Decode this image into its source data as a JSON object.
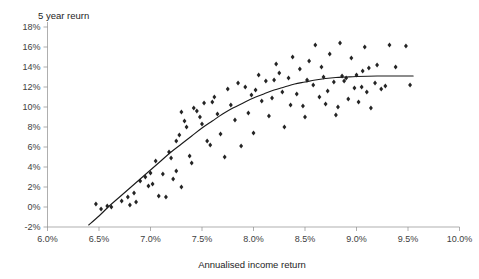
{
  "chart_data": {
    "type": "scatter",
    "title": "",
    "ylabel": "5 year reurn",
    "xlabel": "Annualised income return",
    "xlim": [
      6.0,
      10.0
    ],
    "ylim": [
      -2,
      18
    ],
    "grid": false,
    "legend": "none",
    "x_ticks": [
      "6.0%",
      "6.5%",
      "7.0%",
      "7.5%",
      "8.0%",
      "8.5%",
      "9.0%",
      "9.5%",
      "10.0%"
    ],
    "x_tick_values": [
      6.0,
      6.5,
      7.0,
      7.5,
      8.0,
      8.5,
      9.0,
      9.5,
      10.0
    ],
    "y_ticks": [
      "18%",
      "16%",
      "14%",
      "12%",
      "10%",
      "8%",
      "6%",
      "4%",
      "2%",
      "0%",
      "-2%"
    ],
    "y_tick_values": [
      18,
      16,
      14,
      12,
      10,
      8,
      6,
      4,
      2,
      0,
      -2
    ],
    "marker": "diamond",
    "marker_color": "#242424",
    "trend_color": "#1a1a1a",
    "points": [
      [
        6.47,
        0.3
      ],
      [
        6.52,
        -0.2
      ],
      [
        6.58,
        0.1
      ],
      [
        6.62,
        0.0
      ],
      [
        6.72,
        0.6
      ],
      [
        6.78,
        1.0
      ],
      [
        6.8,
        0.2
      ],
      [
        6.84,
        1.4
      ],
      [
        6.86,
        0.5
      ],
      [
        6.9,
        2.6
      ],
      [
        6.95,
        3.0
      ],
      [
        6.98,
        2.1
      ],
      [
        7.0,
        3.4
      ],
      [
        7.02,
        2.3
      ],
      [
        7.05,
        4.6
      ],
      [
        7.08,
        1.1
      ],
      [
        7.12,
        3.3
      ],
      [
        7.15,
        1.0
      ],
      [
        7.18,
        5.5
      ],
      [
        7.2,
        4.9
      ],
      [
        7.22,
        2.8
      ],
      [
        7.25,
        6.6
      ],
      [
        7.28,
        7.2
      ],
      [
        7.3,
        9.5
      ],
      [
        7.33,
        8.6
      ],
      [
        7.35,
        8.0
      ],
      [
        7.38,
        5.1
      ],
      [
        7.4,
        4.4
      ],
      [
        7.42,
        9.9
      ],
      [
        7.45,
        9.6
      ],
      [
        7.48,
        9.0
      ],
      [
        7.5,
        8.3
      ],
      [
        7.52,
        10.4
      ],
      [
        7.55,
        6.6
      ],
      [
        7.58,
        6.2
      ],
      [
        7.62,
        11.0
      ],
      [
        7.65,
        9.3
      ],
      [
        7.68,
        7.3
      ],
      [
        7.72,
        5.0
      ],
      [
        7.75,
        11.8
      ],
      [
        7.78,
        10.2
      ],
      [
        7.82,
        8.7
      ],
      [
        7.85,
        12.4
      ],
      [
        7.88,
        6.1
      ],
      [
        7.92,
        12.0
      ],
      [
        7.95,
        9.4
      ],
      [
        7.98,
        11.2
      ],
      [
        8.0,
        7.4
      ],
      [
        8.05,
        13.2
      ],
      [
        8.08,
        10.6
      ],
      [
        8.12,
        12.6
      ],
      [
        8.15,
        9.1
      ],
      [
        8.18,
        10.9
      ],
      [
        8.22,
        14.3
      ],
      [
        8.25,
        13.4
      ],
      [
        8.28,
        11.5
      ],
      [
        8.3,
        8.0
      ],
      [
        8.34,
        12.9
      ],
      [
        8.38,
        15.0
      ],
      [
        8.42,
        11.3
      ],
      [
        8.45,
        13.8
      ],
      [
        8.48,
        10.1
      ],
      [
        8.5,
        9.0
      ],
      [
        8.54,
        14.6
      ],
      [
        8.58,
        12.2
      ],
      [
        8.6,
        16.2
      ],
      [
        8.64,
        11.0
      ],
      [
        8.68,
        13.0
      ],
      [
        8.7,
        10.3
      ],
      [
        8.74,
        15.3
      ],
      [
        8.78,
        12.5
      ],
      [
        8.8,
        9.2
      ],
      [
        8.84,
        16.4
      ],
      [
        8.86,
        13.1
      ],
      [
        8.88,
        12.6
      ],
      [
        8.9,
        12.9
      ],
      [
        8.92,
        10.8
      ],
      [
        8.95,
        14.9
      ],
      [
        8.98,
        11.9
      ],
      [
        9.0,
        13.2
      ],
      [
        9.02,
        10.5
      ],
      [
        9.05,
        12.0
      ],
      [
        9.08,
        16.0
      ],
      [
        9.1,
        11.5
      ],
      [
        9.14,
        9.9
      ],
      [
        9.18,
        12.4
      ],
      [
        9.2,
        14.2
      ],
      [
        9.24,
        11.8
      ],
      [
        9.28,
        12.1
      ],
      [
        9.32,
        16.2
      ],
      [
        9.38,
        14.0
      ],
      [
        9.48,
        16.1
      ],
      [
        9.52,
        12.2
      ],
      [
        7.25,
        3.6
      ],
      [
        7.3,
        2.0
      ],
      [
        7.6,
        10.5
      ],
      [
        8.02,
        11.7
      ],
      [
        8.2,
        12.7
      ],
      [
        8.36,
        10.2
      ],
      [
        8.52,
        12.7
      ],
      [
        8.66,
        14.0
      ],
      [
        8.72,
        11.6
      ],
      [
        8.82,
        10.0
      ],
      [
        9.06,
        13.6
      ],
      [
        9.12,
        13.9
      ]
    ],
    "trend_points": [
      [
        6.4,
        -1.8
      ],
      [
        6.5,
        -0.9
      ],
      [
        6.6,
        0.1
      ],
      [
        6.7,
        1.0
      ],
      [
        6.8,
        1.9
      ],
      [
        6.9,
        2.8
      ],
      [
        7.0,
        3.7
      ],
      [
        7.1,
        4.6
      ],
      [
        7.2,
        5.5
      ],
      [
        7.3,
        6.3
      ],
      [
        7.4,
        7.1
      ],
      [
        7.5,
        7.9
      ],
      [
        7.6,
        8.6
      ],
      [
        7.7,
        9.3
      ],
      [
        7.8,
        9.9
      ],
      [
        7.9,
        10.4
      ],
      [
        8.0,
        10.9
      ],
      [
        8.1,
        11.3
      ],
      [
        8.2,
        11.7
      ],
      [
        8.3,
        12.0
      ],
      [
        8.4,
        12.3
      ],
      [
        8.5,
        12.5
      ],
      [
        8.6,
        12.7
      ],
      [
        8.7,
        12.85
      ],
      [
        8.8,
        12.95
      ],
      [
        8.9,
        13.0
      ],
      [
        9.0,
        13.05
      ],
      [
        9.2,
        13.1
      ],
      [
        9.4,
        13.1
      ],
      [
        9.55,
        13.1
      ]
    ]
  }
}
